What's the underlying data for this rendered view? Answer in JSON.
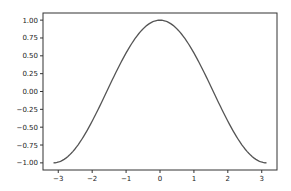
{
  "chart_data": {
    "type": "line",
    "title": "",
    "xlabel": "",
    "ylabel": "",
    "xlim": [
      -3.45,
      3.45
    ],
    "ylim": [
      -1.1,
      1.1
    ],
    "grid": false,
    "legend": null,
    "x_ticks": [
      -3,
      -2,
      -1,
      0,
      1,
      2,
      3
    ],
    "x_tick_labels": [
      "−3",
      "−2",
      "−1",
      "0",
      "1",
      "2",
      "3"
    ],
    "y_ticks": [
      1.0,
      0.75,
      0.5,
      0.25,
      0.0,
      -0.25,
      -0.5,
      -0.75,
      -1.0
    ],
    "y_tick_labels": [
      "1.00",
      "0.75",
      "0.50",
      "0.25",
      "0.00",
      "−0.25",
      "−0.50",
      "−0.75",
      "−1.00"
    ],
    "series": [
      {
        "name": "cos(x)",
        "color": "#555555",
        "x": [
          -3.1416,
          -2.75,
          -2.356,
          -2.0,
          -1.571,
          -1.0,
          -0.785,
          -0.5,
          0.0,
          0.5,
          0.785,
          1.0,
          1.571,
          2.0,
          2.356,
          2.75,
          3.1416
        ],
        "values": [
          -1.0,
          -0.924,
          -0.707,
          -0.416,
          0.0,
          0.54,
          0.707,
          0.878,
          1.0,
          0.878,
          0.707,
          0.54,
          0.0,
          -0.416,
          -0.707,
          -0.924,
          -1.0
        ]
      }
    ]
  },
  "colors": {
    "line": "#555555",
    "axes": "#333333",
    "background": "#ffffff"
  }
}
